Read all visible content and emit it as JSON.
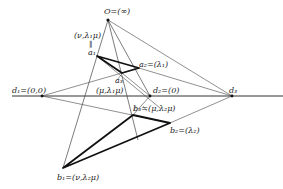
{
  "diagram": {
    "title": "",
    "points": [
      {
        "id": "O",
        "label": "O=(∞)",
        "x": 108,
        "y": 20
      },
      {
        "id": "a1",
        "label": "a₁",
        "x": 97,
        "y": 56
      },
      {
        "id": "a2",
        "label": "a₂=(λ₁)",
        "x": 139,
        "y": 68
      },
      {
        "id": "a3",
        "label": "a₃",
        "x": 122,
        "y": 73
      },
      {
        "id": "d1",
        "label": "d₁=(0,0)",
        "x": 42,
        "y": 96
      },
      {
        "id": "d2",
        "label": "d₂=(0)",
        "x": 150,
        "y": 96
      },
      {
        "id": "d3",
        "label": "d₃",
        "x": 232,
        "y": 96
      },
      {
        "id": "b1",
        "label": "b₁=(ν,λ₂μ)",
        "x": 63,
        "y": 168
      },
      {
        "id": "b2",
        "label": "b₂=(λ₂)",
        "x": 170,
        "y": 123
      },
      {
        "id": "b3",
        "label": "b₃=(μ,λ₂μ)",
        "x": 133,
        "y": 115
      }
    ],
    "annotations": [
      {
        "id": "a1-coord",
        "label": "(ν,λ₁μ)"
      },
      {
        "id": "a1-equiv",
        "label": "‖"
      },
      {
        "id": "a3-coord",
        "label": "(μ,λ₁μ)"
      }
    ],
    "colors": {
      "line": "#333333",
      "heavy": "#111111",
      "text": "#222222"
    }
  },
  "labels": {
    "O": "O=(∞)",
    "a1_coord": "(ν,λ₁μ)",
    "a1_eq": "‖",
    "a1": "a₁",
    "a2": "a₂=(λ₁)",
    "a3": "a₃",
    "a3_coord": "(μ,λ₁μ)",
    "d1": "d₁=(0,0)",
    "d2": "d₂=(0)",
    "d3": "d₃",
    "b3": "b₃=(μ,λ₂μ)",
    "b2": "b₂=(λ₂)",
    "b1": "b₁=(ν,λ₂μ)"
  }
}
